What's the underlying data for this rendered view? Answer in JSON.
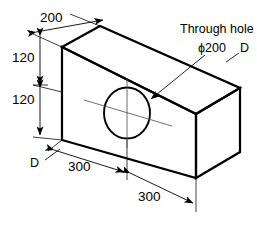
{
  "drawing": {
    "type": "isometric-engineering-drawing",
    "subject": "rectangular block with through hole",
    "background_color": "#ffffff",
    "line_color": "#000000",
    "dimensions": {
      "top_depth": "200",
      "upper_height": "120",
      "lower_height": "120",
      "left_length": "300",
      "right_length": "300"
    },
    "annotations": {
      "through_hole_note": "Through hole",
      "hole_diameter": "ϕ200",
      "section_label_right": "D",
      "section_label_left": "D"
    }
  }
}
